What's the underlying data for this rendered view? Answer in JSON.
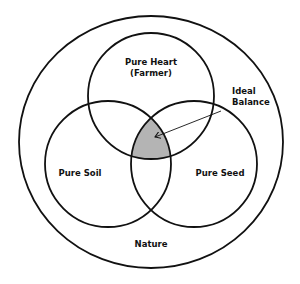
{
  "diagram": {
    "type": "venn",
    "outer": {
      "label": "Nature"
    },
    "sets": [
      {
        "id": "heart",
        "label_line1": "Pure Heart",
        "label_line2": "(Farmer)"
      },
      {
        "id": "soil",
        "label": "Pure Soil"
      },
      {
        "id": "seed",
        "label": "Pure Seed"
      }
    ],
    "intersection": {
      "label_line1": "Ideal",
      "label_line2": "Balance",
      "fill": "#b4b4b4"
    },
    "colors": {
      "stroke": "#111111",
      "background": "#ffffff"
    }
  }
}
